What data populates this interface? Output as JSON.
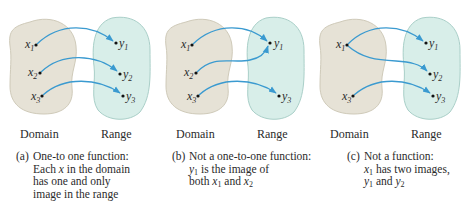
{
  "colors": {
    "domain_fill": "#e6e2d6",
    "domain_stroke": "#cfcab9",
    "range_fill": "#d8eee9",
    "range_stroke": "#a9cfc8",
    "arrow": "#3a9ad0",
    "dot": "#111111",
    "text": "#2b2b2b"
  },
  "panels": [
    {
      "id": "a",
      "domain_label": "Domain",
      "range_label": "Range",
      "domain_points": [
        "x1",
        "x2",
        "x3"
      ],
      "range_points": [
        "y1",
        "y2",
        "y3"
      ],
      "mappings": [
        [
          "x1",
          "y1"
        ],
        [
          "x2",
          "y2"
        ],
        [
          "x3",
          "y3"
        ]
      ],
      "caption": {
        "tag": "(a)",
        "lines": [
          "One-to one function:",
          "Each x in the domain",
          "has one and only",
          "image in the range"
        ]
      }
    },
    {
      "id": "b",
      "domain_label": "Domain",
      "range_label": "Range",
      "domain_points": [
        "x1",
        "x2",
        "x3"
      ],
      "range_points": [
        "y1",
        "y3"
      ],
      "mappings": [
        [
          "x1",
          "y1"
        ],
        [
          "x2",
          "y1"
        ],
        [
          "x3",
          "y3"
        ]
      ],
      "caption": {
        "tag": "(b)",
        "lines": [
          "Not a one-to-one function:",
          "y1 is the image of",
          "both x1 and x2"
        ]
      }
    },
    {
      "id": "c",
      "domain_label": "Domain",
      "range_label": "Range",
      "domain_points": [
        "x1",
        "x3"
      ],
      "range_points": [
        "y1",
        "y2",
        "y3"
      ],
      "mappings": [
        [
          "x1",
          "y1"
        ],
        [
          "x1",
          "y2"
        ],
        [
          "x3",
          "y3"
        ]
      ],
      "caption": {
        "tag": "(c)",
        "lines": [
          "Not a function:",
          "x1 has two images,",
          "y1 and y2"
        ]
      }
    }
  ],
  "text": {
    "a_domain": "Domain",
    "a_range": "Range",
    "b_domain": "Domain",
    "b_range": "Range",
    "c_domain": "Domain",
    "c_range": "Range",
    "a_tag": "(a)",
    "b_tag": "(b)",
    "c_tag": "(c)",
    "a_line1": "One-to one function:",
    "a_line2_pre": "Each ",
    "a_line2_var": "x",
    "a_line2_post": " in the domain",
    "a_line3": "has one and only",
    "a_line4": "image in the range",
    "b_line1": "Not a one-to-one function:",
    "b_line2_var": "y",
    "b_line2_sub": "1",
    "b_line2_post": " is the image of",
    "b_line3_pre": "both ",
    "b_line3_var1": "x",
    "b_line3_sub1": "1",
    "b_line3_mid": " and ",
    "b_line3_var2": "x",
    "b_line3_sub2": "2",
    "c_line1": "Not a function:",
    "c_line2_var": "x",
    "c_line2_sub": "1",
    "c_line2_post": " has two images,",
    "c_line3_var1": "y",
    "c_line3_sub1": "1",
    "c_line3_mid": " and ",
    "c_line3_var2": "y",
    "c_line3_sub2": "2",
    "var_x": "x",
    "var_y": "y",
    "s1": "1",
    "s2": "2",
    "s3": "3"
  }
}
